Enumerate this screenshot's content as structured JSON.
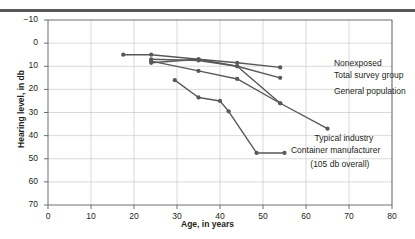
{
  "chart_data": {
    "type": "line",
    "title": "",
    "xlabel": "Age, in years",
    "ylabel": "Hearing level, in db",
    "xlim": [
      0,
      80
    ],
    "ylim": [
      -10,
      70
    ],
    "y_inverted": true,
    "grid": true,
    "xticks": [
      0,
      10,
      20,
      30,
      40,
      50,
      60,
      70,
      80
    ],
    "xticklabels": [
      "0",
      "10",
      "20",
      "30",
      "40",
      "50",
      "60",
      "70",
      "80"
    ],
    "yticks": [
      -10,
      0,
      10,
      20,
      30,
      40,
      50,
      60,
      70
    ],
    "yticklabels": [
      "−10",
      "0",
      "10",
      "20",
      "30",
      "40",
      "50",
      "60",
      "70"
    ],
    "legend_position": "right-inline",
    "line_color": "#58585a",
    "marker_color": "#58585a",
    "grid_color": "#c9c9cb",
    "axis_color": "#6d6e71",
    "series": [
      {
        "name": "Nonexposed",
        "label": "Nonexposed",
        "label_x": 66.5,
        "label_y": 9.0,
        "x": [
          17.5,
          24,
          35,
          44,
          54
        ],
        "y": [
          5,
          5,
          7,
          8.5,
          10.5
        ]
      },
      {
        "name": "Total survey group",
        "label": "Total survey group",
        "label_x": 66.5,
        "label_y": 14.2,
        "x": [
          24,
          35,
          44,
          54
        ],
        "y": [
          7,
          7.5,
          10,
          15
        ]
      },
      {
        "name": "General population",
        "label": "General population",
        "label_x": 66.5,
        "label_y": 21.0,
        "x": [
          24,
          35,
          44,
          54
        ],
        "y": [
          7.8,
          12,
          15.5,
          26
        ]
      },
      {
        "name": "Typical industry",
        "label": "Typical industry",
        "label_x": 62.0,
        "label_y": 41.5,
        "x": [
          24,
          35,
          44,
          54,
          65
        ],
        "y": [
          8.5,
          7,
          10,
          26,
          37
        ]
      },
      {
        "name": "Container manufacturer",
        "label": "Container manufacturer",
        "sublabel": "(105 db overall)",
        "label_x": 56.5,
        "label_y": 46.5,
        "sublabel_x": 61.0,
        "sublabel_y": 52.5,
        "x": [
          29.5,
          35,
          40,
          42,
          48.5,
          55
        ],
        "y": [
          16,
          23.5,
          25,
          29.5,
          47.5,
          47.5
        ]
      }
    ]
  }
}
